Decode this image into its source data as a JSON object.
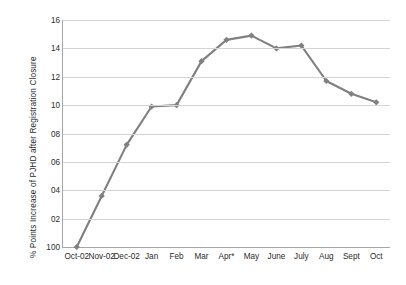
{
  "chart_data": {
    "type": "line",
    "title": "",
    "xlabel": "",
    "ylabel": "% Points Increase of PJHD after Registration Closure",
    "categories": [
      "Oct-02",
      "Nov-02",
      "Dec-02",
      "Jan",
      "Feb",
      "Mar",
      "Apr*",
      "May",
      "June",
      "July",
      "Aug",
      "Sept",
      "Oct"
    ],
    "values": [
      100.0,
      103.6,
      107.2,
      109.9,
      110.0,
      113.1,
      114.6,
      114.9,
      114.0,
      114.2,
      111.7,
      110.8,
      110.2
    ],
    "ylim": [
      100,
      116
    ],
    "ytick_values": [
      100,
      102,
      104,
      106,
      108,
      110,
      112,
      114,
      116
    ],
    "ytick_labels": [
      "100",
      "02",
      "04",
      "06",
      "08",
      "10",
      "12",
      "14",
      "16"
    ],
    "grid": true,
    "legend": false,
    "series_color": "#808080",
    "marker": "diamond",
    "axis_color": "#a6a6a6",
    "grid_color": "#d4d4d4"
  }
}
